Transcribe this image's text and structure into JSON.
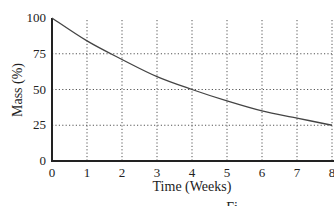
{
  "chart_data": {
    "type": "line",
    "title": "",
    "xlabel": "Time (Weeks)",
    "ylabel": "Mass (%)",
    "xlim": [
      0,
      8
    ],
    "ylim": [
      0,
      100
    ],
    "x_ticks": [
      0,
      1,
      2,
      3,
      4,
      5,
      6,
      7,
      8
    ],
    "y_ticks": [
      0,
      25,
      50,
      75,
      100
    ],
    "grid": {
      "on": true,
      "style": "dotted",
      "x_lines": [
        1,
        2,
        3,
        4,
        5,
        6,
        7,
        8
      ],
      "y_lines": [
        25,
        50,
        75
      ]
    },
    "legend": null,
    "series": [
      {
        "name": "Mass",
        "x": [
          0,
          1,
          2,
          3,
          4,
          5,
          6,
          7,
          8
        ],
        "values": [
          100,
          84,
          71,
          59,
          50,
          42,
          35,
          30,
          25
        ]
      }
    ],
    "caption_fragment": "Fi"
  }
}
